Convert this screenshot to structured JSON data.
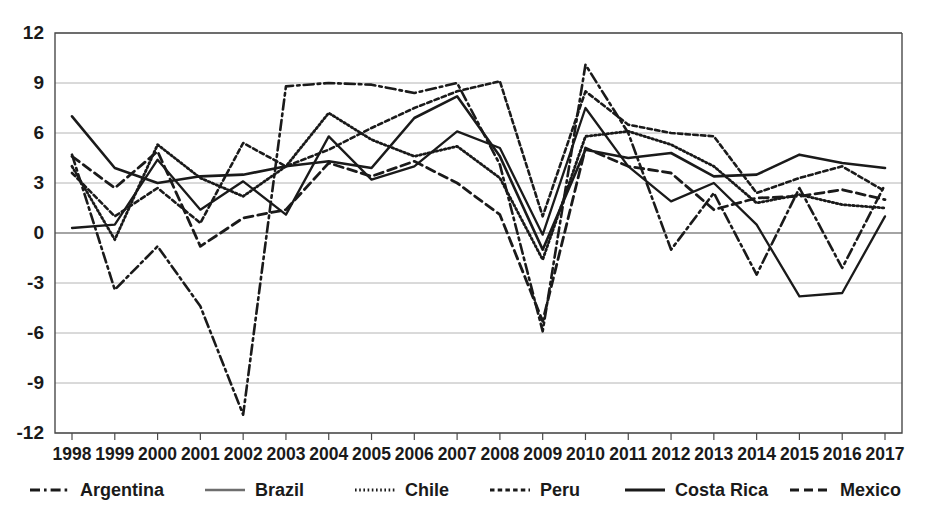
{
  "chart_data": {
    "type": "line",
    "title": "",
    "subtitle": "",
    "xlabel": "",
    "ylabel": "",
    "grid": true,
    "legend_position": "bottom",
    "xlim": [
      1998,
      2017
    ],
    "ylim": [
      -12,
      12
    ],
    "y_ticks": [
      12,
      9,
      6,
      3,
      0,
      -3,
      -6,
      -9,
      -12
    ],
    "categories": [
      "1998",
      "1999",
      "2000",
      "2001",
      "2002",
      "2003",
      "2004",
      "2005",
      "2006",
      "2007",
      "2008",
      "2009",
      "2010",
      "2011",
      "2012",
      "2013",
      "2014",
      "2015",
      "2016",
      "2017"
    ],
    "series": [
      {
        "name": "Argentina",
        "style": "dash-dot",
        "color": "#1a1a1a",
        "values": [
          4.7,
          -3.4,
          -0.8,
          -4.4,
          -10.9,
          8.8,
          9.0,
          8.9,
          8.4,
          9.0,
          4.1,
          -5.9,
          10.1,
          6.0,
          -1.0,
          2.4,
          -2.5,
          2.7,
          -2.1,
          2.9
        ]
      },
      {
        "name": "Brazil",
        "style": "solid-gray",
        "color": "#6e6e6e",
        "values": [
          0.3,
          0.5,
          4.4,
          1.4,
          3.1,
          1.1,
          5.8,
          3.2,
          4.0,
          6.1,
          5.1,
          -0.1,
          7.5,
          4.0,
          1.9,
          3.0,
          0.5,
          -3.8,
          -3.6,
          1.0
        ]
      },
      {
        "name": "Chile",
        "style": "dotted",
        "color": "#1a1a1a",
        "values": [
          4.0,
          -0.4,
          5.3,
          3.3,
          2.2,
          4.0,
          7.2,
          5.6,
          4.6,
          5.2,
          3.3,
          -1.6,
          5.8,
          6.1,
          5.3,
          4.0,
          1.8,
          2.3,
          1.7,
          1.5
        ]
      },
      {
        "name": "Peru",
        "style": "dotted-dash",
        "color": "#1a1a1a",
        "values": [
          3.6,
          1.0,
          2.7,
          0.6,
          5.4,
          4.0,
          5.0,
          6.3,
          7.5,
          8.5,
          9.1,
          1.0,
          8.5,
          6.5,
          6.0,
          5.8,
          2.4,
          3.3,
          4.0,
          2.5
        ]
      },
      {
        "name": "Costa Rica",
        "style": "solid",
        "color": "#1a1a1a",
        "values": [
          7.0,
          3.9,
          3.0,
          3.4,
          3.5,
          4.0,
          4.3,
          3.9,
          6.9,
          8.2,
          4.6,
          -1.0,
          5.0,
          4.5,
          4.8,
          3.4,
          3.5,
          4.7,
          4.2,
          3.9
        ]
      },
      {
        "name": "Mexico",
        "style": "dashed",
        "color": "#1a1a1a",
        "values": [
          4.6,
          2.7,
          4.9,
          -0.8,
          0.9,
          1.4,
          4.2,
          3.4,
          4.3,
          3.0,
          1.1,
          -5.3,
          5.1,
          4.0,
          3.6,
          1.4,
          2.1,
          2.2,
          2.6,
          2.0
        ]
      }
    ]
  },
  "legend": {
    "items": [
      {
        "label": "Argentina"
      },
      {
        "label": "Brazil"
      },
      {
        "label": "Chile"
      },
      {
        "label": "Peru"
      },
      {
        "label": "Costa Rica"
      },
      {
        "label": "Mexico"
      }
    ]
  }
}
